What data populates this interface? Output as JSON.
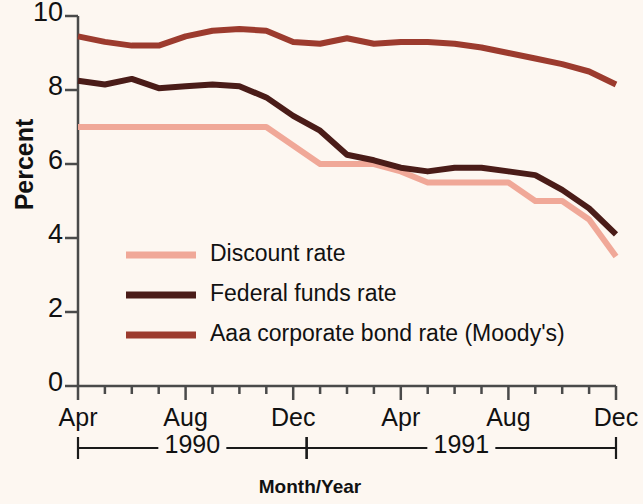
{
  "chart_data": {
    "type": "line",
    "title": "",
    "xlabel": "Month/Year",
    "ylabel": "Percent",
    "ylim": [
      0,
      10
    ],
    "yticks": [
      0,
      2,
      4,
      6,
      8,
      10
    ],
    "ytick_labels": [
      "0",
      "2",
      "4",
      "6",
      "8",
      "10"
    ],
    "grid": false,
    "legend_position": "inside-lower-left",
    "x": [
      "Apr 1990",
      "May 1990",
      "Jun 1990",
      "Jul 1990",
      "Aug 1990",
      "Sep 1990",
      "Oct 1990",
      "Nov 1990",
      "Dec 1990",
      "Jan 1991",
      "Feb 1991",
      "Mar 1991",
      "Apr 1991",
      "May 1991",
      "Jun 1991",
      "Jul 1991",
      "Aug 1991",
      "Sep 1991",
      "Oct 1991",
      "Nov 1991",
      "Dec 1991"
    ],
    "xtick_labels": [
      "Apr",
      "Aug",
      "Dec",
      "Apr",
      "Aug",
      "Dec"
    ],
    "xtick_label_positions": [
      "Apr 1990",
      "Aug 1990",
      "Dec 1990",
      "Apr 1991",
      "Aug 1991",
      "Dec 1991"
    ],
    "year_brackets": [
      {
        "label": "1990",
        "start": "Apr 1990",
        "end": "Dec 1990"
      },
      {
        "label": "1991",
        "start": "Jan 1991",
        "end": "Dec 1991"
      }
    ],
    "series": [
      {
        "name": "Discount rate",
        "color": "#f0a898",
        "values": [
          7.0,
          7.0,
          7.0,
          7.0,
          7.0,
          7.0,
          7.0,
          7.0,
          6.5,
          6.0,
          6.0,
          6.0,
          5.8,
          5.5,
          5.5,
          5.5,
          5.5,
          5.0,
          5.0,
          4.5,
          3.5
        ]
      },
      {
        "name": "Federal funds rate",
        "color": "#4a1c18",
        "values": [
          8.25,
          8.15,
          8.3,
          8.05,
          8.1,
          8.15,
          8.1,
          7.8,
          7.3,
          6.9,
          6.25,
          6.1,
          5.9,
          5.8,
          5.9,
          5.9,
          5.8,
          5.7,
          5.3,
          4.8,
          4.1
        ]
      },
      {
        "name": "Aaa corporate bond rate (Moody's)",
        "color": "#9c3b2e",
        "values": [
          9.45,
          9.3,
          9.2,
          9.2,
          9.45,
          9.6,
          9.65,
          9.6,
          9.3,
          9.25,
          9.4,
          9.25,
          9.3,
          9.3,
          9.25,
          9.15,
          9.0,
          8.85,
          8.7,
          8.5,
          8.15
        ]
      }
    ]
  },
  "axis": {
    "y_title": "Percent",
    "x_title": "Month/Year"
  }
}
